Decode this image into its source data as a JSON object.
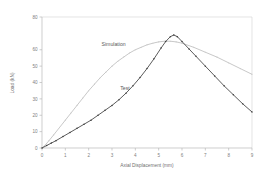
{
  "chart_data": {
    "type": "line",
    "title": "",
    "xlabel": "Axial Displacement (mm)",
    "ylabel": "Load (kN)",
    "xlim": [
      0,
      9
    ],
    "ylim": [
      0,
      80
    ],
    "xticks": [
      0,
      1,
      2,
      3,
      4,
      5,
      6,
      7,
      8,
      9
    ],
    "yticks": [
      0,
      10,
      20,
      30,
      40,
      50,
      60,
      80
    ],
    "xtick_labels": [
      "0",
      "1",
      "2",
      "3",
      "4",
      "5",
      "6",
      "7",
      "8",
      "9"
    ],
    "ytick_labels": [
      "0",
      "10",
      "20",
      "30",
      "40",
      "50",
      "60",
      "80"
    ],
    "grid": false,
    "legend_position": "inline-annotation",
    "series": [
      {
        "name": "Simulation",
        "color": "#c2c2c2",
        "style": "line-with-small-markers",
        "label_x": 2.55,
        "label_y": 62.5,
        "x": [
          0.0,
          0.15,
          0.3,
          0.5,
          0.75,
          1.0,
          1.25,
          1.5,
          1.75,
          2.0,
          2.25,
          2.5,
          2.75,
          3.0,
          3.25,
          3.5,
          3.75,
          4.0,
          4.25,
          4.5,
          4.75,
          5.0,
          5.25,
          5.5,
          5.75,
          6.0,
          6.5,
          7.0,
          7.5,
          8.0,
          8.5,
          9.0
        ],
        "y": [
          0.0,
          2.0,
          4.5,
          8.0,
          12.5,
          17.0,
          21.5,
          26.0,
          30.5,
          35.0,
          39.0,
          43.0,
          46.5,
          50.0,
          53.0,
          55.5,
          58.0,
          60.0,
          61.5,
          63.0,
          64.0,
          64.8,
          65.2,
          65.2,
          64.8,
          64.0,
          61.5,
          58.5,
          55.5,
          52.0,
          48.5,
          45.0
        ]
      },
      {
        "name": "Test",
        "color": "#4a4a4a",
        "style": "line-with-dot-markers",
        "label_x": 3.35,
        "label_y": 35.5,
        "x": [
          0.0,
          0.2,
          0.4,
          0.6,
          0.9,
          1.2,
          1.5,
          1.8,
          2.1,
          2.4,
          2.7,
          3.0,
          3.3,
          3.6,
          3.9,
          4.2,
          4.5,
          4.8,
          5.1,
          5.3,
          5.5,
          5.65,
          5.8,
          6.0,
          6.3,
          6.6,
          7.0,
          7.4,
          7.8,
          8.2,
          8.6,
          9.0
        ],
        "y": [
          0.0,
          1.5,
          3.0,
          4.5,
          7.0,
          9.5,
          12.0,
          14.5,
          17.0,
          20.0,
          23.0,
          26.0,
          29.5,
          33.5,
          38.0,
          43.0,
          48.5,
          54.5,
          61.0,
          65.0,
          68.0,
          69.0,
          68.0,
          65.0,
          60.5,
          56.0,
          50.0,
          44.0,
          38.0,
          32.5,
          27.0,
          22.0
        ]
      }
    ]
  }
}
